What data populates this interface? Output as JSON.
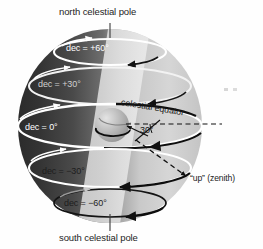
{
  "figure": {
    "kind": "celestial-sphere-diagram",
    "width": 263,
    "height": 249,
    "background_color": "#ffffff"
  },
  "labels": {
    "north_pole": "north celestial pole",
    "south_pole": "south celestial pole",
    "celestial_equator": "celestial equator",
    "angle": "30°",
    "zenith": "“up” (zenith)"
  },
  "declination_circles": [
    {
      "id": "dec-plus-60",
      "label": "dec = +60°",
      "value": 60,
      "text_style": "white"
    },
    {
      "id": "dec-plus-30",
      "label": "dec = +30°",
      "value": 30,
      "text_style": "faint"
    },
    {
      "id": "dec-zero",
      "label": "dec = 0°",
      "value": 0,
      "text_style": "white"
    },
    {
      "id": "dec-minus-30",
      "label": "dec = −30°",
      "value": -30,
      "text_style": "dark"
    },
    {
      "id": "dec-minus-60",
      "label": "dec = −60°",
      "value": -60,
      "text_style": "dark"
    }
  ],
  "colors": {
    "sphere_dark": "#3a3a3a",
    "sphere_light": "#d2d2d2",
    "lit_band": "#e2e2e2",
    "ring_white": "#ffffff",
    "ring_dark": "#101010",
    "text_dark": "#1d1d1d",
    "text_white": "#ffffff",
    "earth_fill": "#b8b8b8",
    "speck": "#d8d8d8"
  },
  "annotations": {
    "dashed_horizon_line": true,
    "dashed_zenith_arrow": true,
    "pole_tick_marks": 2,
    "specks": 2
  }
}
